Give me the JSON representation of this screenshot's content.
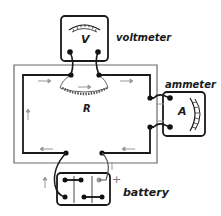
{
  "diagram": {
    "type": "electric circuit",
    "labels": {
      "voltmeter": "voltmeter",
      "voltmeter_symbol": "V",
      "ammeter": "ammeter",
      "ammeter_symbol": "A",
      "resistor_symbol": "R",
      "battery": "battery",
      "battery_positive": "+"
    },
    "components": [
      {
        "name": "voltmeter",
        "symbol": "V",
        "connection": "parallel across R"
      },
      {
        "name": "resistor",
        "symbol": "R",
        "shape": "coil"
      },
      {
        "name": "ammeter",
        "symbol": "A",
        "connection": "series"
      },
      {
        "name": "battery",
        "cells": 3,
        "terminal": "+"
      }
    ],
    "current_direction": "clockwise (arrows along wires)",
    "colors": {
      "wire": "#1a1a1a",
      "frame": "#666666",
      "arrow": "#999999",
      "background": "#ffffff"
    }
  }
}
